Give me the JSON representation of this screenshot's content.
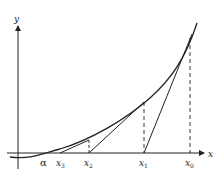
{
  "diagram": {
    "axes": {
      "x_label": "x",
      "y_label": "y"
    },
    "root_label": "α",
    "iterates": [
      {
        "name": "x",
        "sub": "0"
      },
      {
        "name": "x",
        "sub": "1"
      },
      {
        "name": "x",
        "sub": "2"
      },
      {
        "name": "x",
        "sub": "3"
      }
    ],
    "colors": {
      "line": "#222222",
      "background": "#ffffff"
    }
  }
}
